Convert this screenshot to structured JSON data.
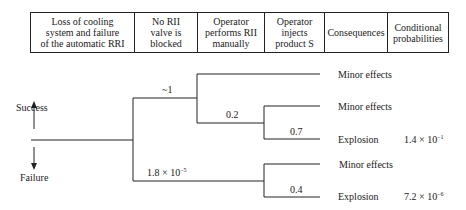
{
  "header": {
    "columns": [
      {
        "label": "Loss of cooling system and failure of the automatic RRI",
        "lines": [
          "Loss of cooling",
          "system and failure",
          "of the automatic RRI"
        ]
      },
      {
        "label": "No RII valve is blocked",
        "lines": [
          "No RII",
          "valve is",
          "blocked"
        ]
      },
      {
        "label": "Operator performs RII manually",
        "lines": [
          "Operator",
          "performs RII",
          "manually"
        ]
      },
      {
        "label": "Operator injects product S",
        "lines": [
          "Operator",
          "injects",
          "product S"
        ]
      },
      {
        "label": "Consequences",
        "lines": [
          "Consequences"
        ]
      },
      {
        "label": "Conditional probabilities",
        "lines": [
          "Conditional",
          "probabilities"
        ]
      }
    ]
  },
  "legend": {
    "success": "Success",
    "failure": "Failure"
  },
  "branches": {
    "b1_prob": "~1",
    "b2_prob": "0.2",
    "b3_prob": "0.7",
    "b4_prob_base": "1.8 × 10",
    "b4_prob_exp": "−5",
    "b5_prob": "0.4"
  },
  "outcomes": [
    {
      "consequence": "Minor effects",
      "probability": ""
    },
    {
      "consequence": "Minor effects",
      "probability": ""
    },
    {
      "consequence": "Explosion",
      "probability_base": "1.4 × 10",
      "probability_exp": "−1"
    },
    {
      "consequence": "Minor effects",
      "probability": ""
    },
    {
      "consequence": "Explosion",
      "probability_base": "7.2 × 10",
      "probability_exp": "−6"
    }
  ],
  "colors": {
    "line": "#222222",
    "text": "#1a1a1a",
    "background": "#ffffff"
  }
}
